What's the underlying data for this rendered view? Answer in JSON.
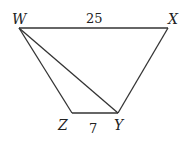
{
  "diagram": {
    "type": "trapezoid",
    "vertices": [
      {
        "id": "W",
        "label": "W",
        "x": 19,
        "y": 28
      },
      {
        "id": "X",
        "label": "X",
        "x": 168,
        "y": 28
      },
      {
        "id": "Y",
        "label": "Y",
        "x": 118,
        "y": 113
      },
      {
        "id": "Z",
        "label": "Z",
        "x": 72,
        "y": 113
      }
    ],
    "edges": [
      {
        "from": "W",
        "to": "X",
        "label": "25"
      },
      {
        "from": "X",
        "to": "Y",
        "label": ""
      },
      {
        "from": "Y",
        "to": "Z",
        "label": "7"
      },
      {
        "from": "Z",
        "to": "W",
        "label": ""
      },
      {
        "from": "W",
        "to": "Y",
        "label": "",
        "kind": "diagonal"
      }
    ],
    "labels": {
      "W": "W",
      "X": "X",
      "Y": "Y",
      "Z": "Z",
      "WX_length": "25",
      "ZY_length": "7"
    },
    "colors": {
      "stroke": "#333333",
      "text": "#222222",
      "background": "#ffffff"
    }
  }
}
